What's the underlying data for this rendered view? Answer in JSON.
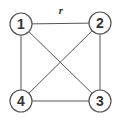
{
  "diagram": {
    "type": "complete-graph",
    "nodes": [
      {
        "id": "1",
        "label": "1",
        "x": 21,
        "y": 24
      },
      {
        "id": "2",
        "label": "2",
        "x": 100,
        "y": 23
      },
      {
        "id": "3",
        "label": "3",
        "x": 100,
        "y": 101
      },
      {
        "id": "4",
        "label": "4",
        "x": 21,
        "y": 101
      }
    ],
    "edges": [
      {
        "from": "1",
        "to": "2",
        "label": "r"
      },
      {
        "from": "1",
        "to": "3",
        "label": ""
      },
      {
        "from": "1",
        "to": "4",
        "label": ""
      },
      {
        "from": "2",
        "to": "3",
        "label": ""
      },
      {
        "from": "2",
        "to": "4",
        "label": ""
      },
      {
        "from": "3",
        "to": "4",
        "label": ""
      }
    ],
    "edge_label_r": {
      "text": "r",
      "x": 61,
      "y": 14
    }
  }
}
